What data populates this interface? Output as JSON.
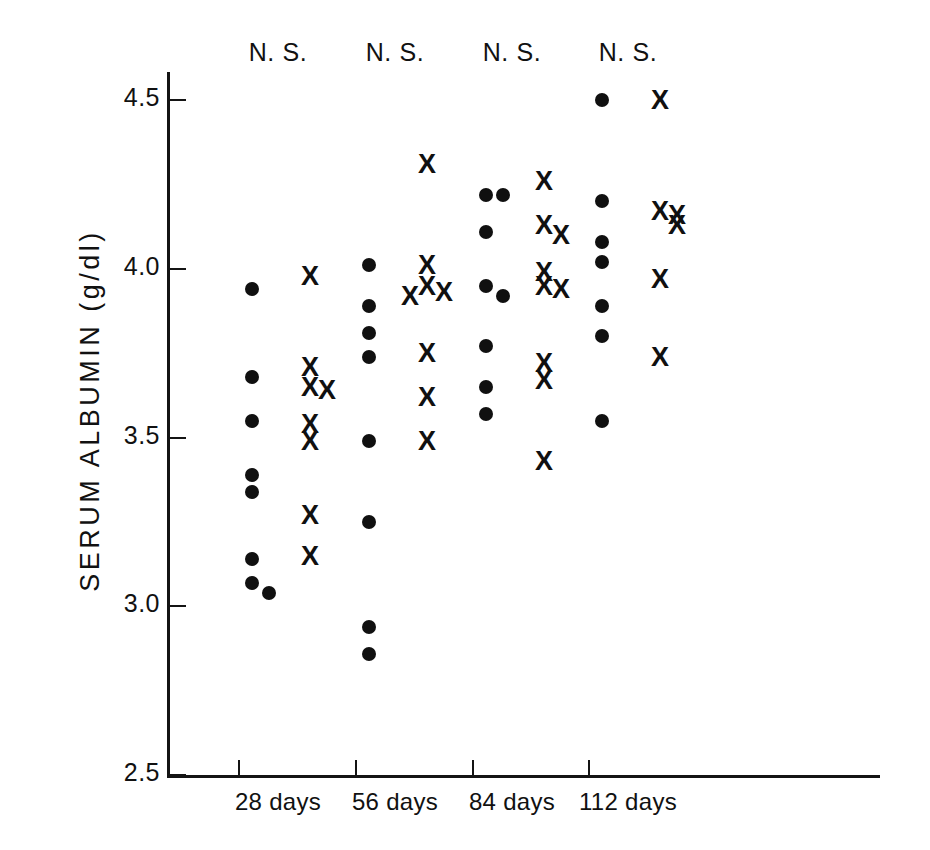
{
  "chart_data": {
    "type": "scatter",
    "title": "",
    "xlabel": "",
    "ylabel": "SERUM  ALBUMIN  (g/dl)",
    "ylim": [
      2.5,
      4.5
    ],
    "yticks": [
      4.5,
      4.0,
      3.5,
      3.0,
      2.5
    ],
    "ytick_labels": [
      "4.5",
      "4.0",
      "3.5",
      "3.0",
      "2.5"
    ],
    "grid": false,
    "legend": "none",
    "categories": [
      "28 days",
      "56 days",
      "84 days",
      "112 days"
    ],
    "annotations": [
      "N. S.",
      "N. S.",
      "N. S.",
      "N. S."
    ],
    "series": [
      {
        "name": "dot-group",
        "marker": "filled-circle",
        "groups": [
          {
            "category": "28 days",
            "values": [
              3.94,
              3.68,
              3.55,
              3.39,
              3.34,
              3.14,
              3.07,
              3.04
            ]
          },
          {
            "category": "56 days",
            "values": [
              4.01,
              3.89,
              3.81,
              3.74,
              3.49,
              3.25,
              2.94,
              2.86
            ]
          },
          {
            "category": "84 days",
            "values": [
              4.22,
              4.22,
              4.11,
              3.95,
              3.92,
              3.77,
              3.65,
              3.57
            ]
          },
          {
            "category": "112 days",
            "values": [
              4.5,
              4.2,
              4.08,
              4.02,
              3.89,
              3.8,
              3.55
            ]
          }
        ]
      },
      {
        "name": "cross-group",
        "marker": "bold-x",
        "groups": [
          {
            "category": "28 days",
            "values": [
              3.98,
              3.71,
              3.65,
              3.64,
              3.54,
              3.49,
              3.27,
              3.15
            ]
          },
          {
            "category": "56 days",
            "values": [
              4.31,
              4.01,
              3.95,
              3.93,
              3.92,
              3.75,
              3.62,
              3.49
            ]
          },
          {
            "category": "84 days",
            "values": [
              4.26,
              4.13,
              4.1,
              3.99,
              3.95,
              3.94,
              3.72,
              3.67,
              3.43
            ]
          },
          {
            "category": "112 days",
            "values": [
              4.5,
              4.17,
              4.16,
              4.13,
              3.97,
              3.74
            ]
          }
        ]
      }
    ]
  },
  "axes": {
    "y_title": "SERUM  ALBUMIN  (g/dl)",
    "y_tick_labels": [
      "4.5",
      "4.0",
      "3.5",
      "3.0",
      "2.5"
    ],
    "x_tick_labels": [
      "28 days",
      "56 days",
      "84 days",
      "112 days"
    ],
    "significance_labels": [
      "N. S.",
      "N. S.",
      "N. S.",
      "N. S."
    ]
  },
  "colors": {
    "ink": "#101010",
    "background": "#ffffff"
  }
}
